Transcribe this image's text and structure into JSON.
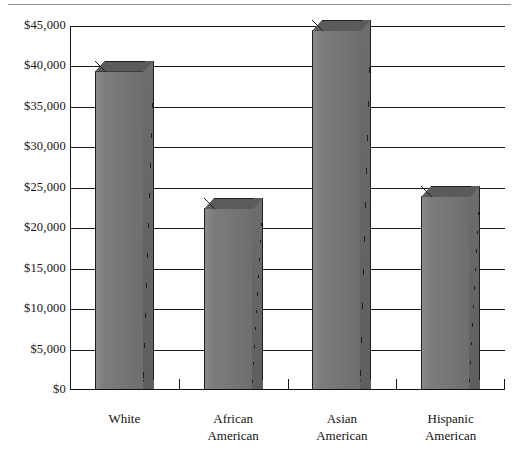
{
  "page": {
    "has_top_rule": true
  },
  "chart_data": {
    "type": "bar",
    "title": "",
    "subtitle": "",
    "xlabel": "",
    "ylabel": "",
    "categories": [
      "White",
      "African American",
      "Asian American",
      "Hispanic American"
    ],
    "category_lines": [
      [
        "White"
      ],
      [
        "African",
        "American"
      ],
      [
        "Asian",
        "American"
      ],
      [
        "Hispanic",
        "American"
      ]
    ],
    "values": [
      39500,
      22500,
      44500,
      24000
    ],
    "ylim": [
      0,
      45000
    ],
    "ytick_values": [
      0,
      5000,
      10000,
      15000,
      20000,
      25000,
      30000,
      35000,
      40000,
      45000
    ],
    "ytick_labels": [
      "$0",
      "$5,000",
      "$10,000",
      "$15,000",
      "$20,000",
      "$25,000",
      "$30,000",
      "$35,000",
      "$40,000",
      "$45,000"
    ],
    "grid": true,
    "grid_orientation": "horizontal",
    "legend": false,
    "style": "3d-columns",
    "bar_color": "#767676",
    "bar_side_color": "#616161",
    "bar_top_color": "#59595c",
    "bar_outline_color": "#1e1e1e",
    "axis_color": "#1a1a1a",
    "background": "#ffffff"
  }
}
